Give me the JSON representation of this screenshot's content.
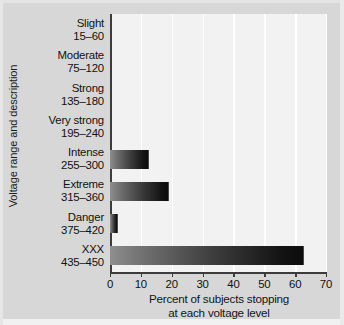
{
  "chart_data": {
    "type": "bar",
    "orientation": "horizontal",
    "title": "",
    "xlabel": "Percent of subjects stopping at each voltage level",
    "xlabel_lines": [
      "Percent of subjects stopping",
      "at each voltage level"
    ],
    "ylabel": "Voltage range and description",
    "xlim": [
      0,
      70
    ],
    "xticks": [
      0,
      10,
      20,
      30,
      40,
      50,
      60,
      70
    ],
    "xtick_labels": [
      "0",
      "10",
      "20",
      "30",
      "40",
      "50",
      "60",
      "70"
    ],
    "grid": "vertical",
    "legend": "none",
    "categories": [
      "Slight 15–60",
      "Moderate 75–120",
      "Strong 135–180",
      "Very strong 195–240",
      "Intense 255–300",
      "Extreme 315–360",
      "Danger 375–420",
      "XXX 435–450"
    ],
    "category_labels": [
      {
        "desc": "Slight",
        "range": "15–60"
      },
      {
        "desc": "Moderate",
        "range": "75–120"
      },
      {
        "desc": "Strong",
        "range": "135–180"
      },
      {
        "desc": "Very strong",
        "range": "195–240"
      },
      {
        "desc": "Intense",
        "range": "255–300"
      },
      {
        "desc": "Extreme",
        "range": "315–360"
      },
      {
        "desc": "Danger",
        "range": "375–420"
      },
      {
        "desc": "XXX",
        "range": "435–450"
      }
    ],
    "values": [
      0,
      0,
      0,
      0,
      12.5,
      19,
      2.5,
      63
    ],
    "bar_gradient": {
      "from": "#8e8e8e",
      "to": "#0c0c0c"
    },
    "colors": {
      "figure_background": "#d7d7d7",
      "plot_background": "#f2f2f2",
      "axis_line": "#3c3c3c",
      "gridline": "#ffffff",
      "text": "#111111"
    }
  }
}
